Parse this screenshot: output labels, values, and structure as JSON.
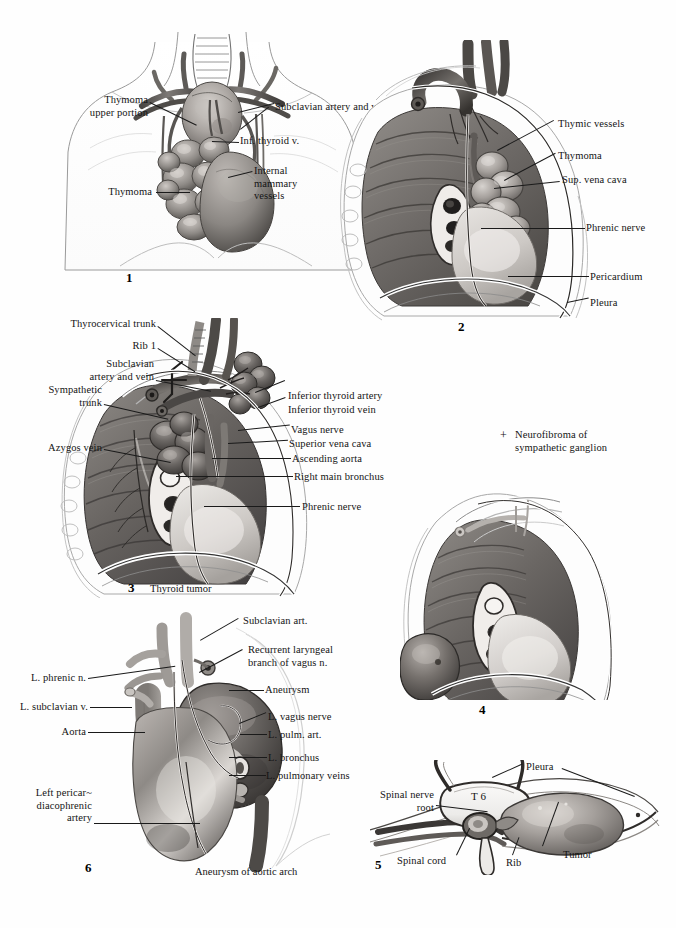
{
  "plate": {
    "title": "Tumors and Aneurysms of the Mediastinum",
    "background_color": "#fefefe",
    "ink_color": "#141414"
  },
  "figures": [
    {
      "number": "1",
      "name": "thymoma-anterior-view",
      "caption": "",
      "labels": [
        {
          "id": "f1-thymoma-upper",
          "text": "Thymoma\nupper portion",
          "align": "right"
        },
        {
          "id": "f1-subclavian",
          "text": "Subclavian artery and vein",
          "align": "left"
        },
        {
          "id": "f1-inf-thyroid-v",
          "text": "Inf. thyroid v.",
          "align": "left"
        },
        {
          "id": "f1-internal-mammary",
          "text": "Internal\nmammary\nvessels",
          "align": "left"
        },
        {
          "id": "f1-thymoma",
          "text": "Thymoma",
          "align": "right"
        }
      ]
    },
    {
      "number": "2",
      "name": "thymoma-right-lateral-view",
      "caption": "",
      "labels": [
        {
          "id": "f2-thymic-vessels",
          "text": "Thymic vessels",
          "align": "left"
        },
        {
          "id": "f2-thymoma",
          "text": "Thymoma",
          "align": "left"
        },
        {
          "id": "f2-sup-vena-cava",
          "text": "Sup. vena cava",
          "align": "left"
        },
        {
          "id": "f2-phrenic-nerve",
          "text": "Phrenic nerve",
          "align": "left"
        },
        {
          "id": "f2-pericardium",
          "text": "Pericardium",
          "align": "left"
        },
        {
          "id": "f2-pleura",
          "text": "Pleura",
          "align": "left"
        }
      ]
    },
    {
      "number": "3",
      "name": "thyroid-tumor-right-lateral-view",
      "caption": "Thyroid tumor",
      "labels": [
        {
          "id": "f3-thyrocervical",
          "text": "Thyrocervical trunk",
          "align": "right"
        },
        {
          "id": "f3-rib1",
          "text": "Rib 1",
          "align": "right"
        },
        {
          "id": "f3-subclavian",
          "text": "Subclavian\nartery and vein",
          "align": "right"
        },
        {
          "id": "f3-sympathetic",
          "text": "Sympathetic\ntrunk",
          "align": "right"
        },
        {
          "id": "f3-azygos",
          "text": "Azygos vein",
          "align": "right"
        },
        {
          "id": "f3-inf-thyroid-artery",
          "text": "Inferior thyroid artery",
          "align": "left"
        },
        {
          "id": "f3-inf-thyroid-vein",
          "text": "Inferior thyroid vein",
          "align": "left"
        },
        {
          "id": "f3-vagus",
          "text": "Vagus nerve",
          "align": "left"
        },
        {
          "id": "f3-svc",
          "text": "Superior vena cava",
          "align": "left"
        },
        {
          "id": "f3-ascending-aorta",
          "text": "Ascending aorta",
          "align": "left"
        },
        {
          "id": "f3-right-main-bronchus",
          "text": "Right main bronchus",
          "align": "left"
        },
        {
          "id": "f3-phrenic",
          "text": "Phrenic nerve",
          "align": "left"
        }
      ]
    },
    {
      "number": "4",
      "name": "neurofibroma-left-lateral-view",
      "caption": "",
      "labels": [
        {
          "id": "f4-neurofibroma",
          "text": "Neurofibroma of\nsympathetic ganglion",
          "align": "left",
          "marker": "+"
        }
      ]
    },
    {
      "number": "5",
      "name": "posterior-mediastinal-tumor-cross-section",
      "caption": "",
      "labels": [
        {
          "id": "f5-pleura",
          "text": "Pleura",
          "align": "left"
        },
        {
          "id": "f5-spinal-nerve-root",
          "text": "Spinal nerve\nroot",
          "align": "right"
        },
        {
          "id": "f5-t6",
          "text": "T 6",
          "align": "center"
        },
        {
          "id": "f5-spinal-cord",
          "text": "Spinal cord",
          "align": "left"
        },
        {
          "id": "f5-rib",
          "text": "Rib",
          "align": "left"
        },
        {
          "id": "f5-tumor",
          "text": "Tumor",
          "align": "left"
        }
      ]
    },
    {
      "number": "6",
      "name": "aortic-arch-aneurysm-left-lateral-view",
      "caption": "Aneurysm of aortic arch",
      "labels": [
        {
          "id": "f6-subclavian-art",
          "text": "Subclavian art.",
          "align": "left"
        },
        {
          "id": "f6-recurrent-laryngeal",
          "text": "Recurrent laryngeal\nbranch of vagus n.",
          "align": "left"
        },
        {
          "id": "f6-aneurysm",
          "text": "Aneurysm",
          "align": "left"
        },
        {
          "id": "f6-l-vagus",
          "text": "L. vagus nerve",
          "align": "left"
        },
        {
          "id": "f6-l-pulm-art",
          "text": "L. pulm. art.",
          "align": "left"
        },
        {
          "id": "f6-l-bronchus",
          "text": "L. bronchus",
          "align": "left"
        },
        {
          "id": "f6-l-pulmonary-veins",
          "text": "L. pulmonary veins",
          "align": "left"
        },
        {
          "id": "f6-l-phrenic",
          "text": "L. phrenic n.",
          "align": "right"
        },
        {
          "id": "f6-l-subclavian-v",
          "text": "L. subclavian v.",
          "align": "right"
        },
        {
          "id": "f6-aorta",
          "text": "Aorta",
          "align": "right"
        },
        {
          "id": "f6-left-pericardiacophrenic",
          "text": "Left pericar~\ndiacophrenic\nartery",
          "align": "right"
        }
      ]
    }
  ]
}
